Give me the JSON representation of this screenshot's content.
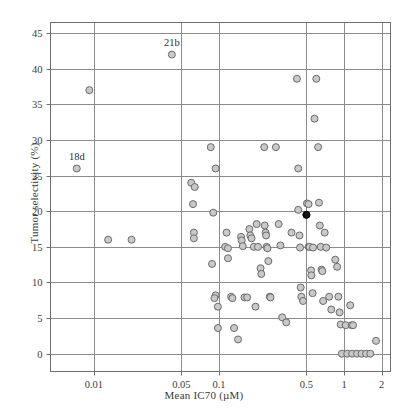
{
  "chart_data": {
    "type": "scatter",
    "title": "",
    "xlabel": "Mean IC70 (µM)",
    "ylabel": "Tumor selectivity (%)",
    "xscale": "log",
    "yscale": "linear",
    "xlim": [
      0.0045,
      2.35
    ],
    "ylim": [
      -2.5,
      46.5
    ],
    "xticks": [
      0.01,
      0.05,
      0.1,
      0.5,
      1,
      2
    ],
    "xtick_labels": [
      "0.01",
      "0.05",
      "0.1",
      "0.5",
      "1",
      "2"
    ],
    "yticks": [
      0,
      5,
      10,
      15,
      20,
      25,
      30,
      35,
      40,
      45
    ],
    "ytick_labels": [
      "0",
      "5",
      "10",
      "15",
      "20",
      "25",
      "30",
      "35",
      "40",
      "45"
    ],
    "grid": true,
    "grid_color": "#8c8c8c",
    "frame_color": "#6f6f6f",
    "legend": "none",
    "marker_fill": "#c9c9c9",
    "marker_edge": "#6a6a6a",
    "highlight_fill": "#151515",
    "highlight_edge": "#000000",
    "marker_size": 7,
    "annotations": [
      {
        "label": "21b",
        "x": 0.042,
        "y": 42
      },
      {
        "label": "18d",
        "x": 0.0073,
        "y": 26
      }
    ],
    "highlight_points": [
      {
        "x": 0.5,
        "y": 19.5
      }
    ],
    "points": [
      {
        "x": 0.0073,
        "y": 26
      },
      {
        "x": 0.0092,
        "y": 37
      },
      {
        "x": 0.013,
        "y": 16
      },
      {
        "x": 0.02,
        "y": 16
      },
      {
        "x": 0.042,
        "y": 42
      },
      {
        "x": 0.06,
        "y": 24
      },
      {
        "x": 0.064,
        "y": 23.4
      },
      {
        "x": 0.062,
        "y": 21
      },
      {
        "x": 0.063,
        "y": 17
      },
      {
        "x": 0.063,
        "y": 16.2
      },
      {
        "x": 0.086,
        "y": 29
      },
      {
        "x": 0.094,
        "y": 26
      },
      {
        "x": 0.09,
        "y": 19.8
      },
      {
        "x": 0.088,
        "y": 12.6
      },
      {
        "x": 0.094,
        "y": 8.2
      },
      {
        "x": 0.092,
        "y": 7.8
      },
      {
        "x": 0.098,
        "y": 6.6
      },
      {
        "x": 0.098,
        "y": 3.6
      },
      {
        "x": 0.115,
        "y": 17
      },
      {
        "x": 0.112,
        "y": 15
      },
      {
        "x": 0.118,
        "y": 14.8
      },
      {
        "x": 0.118,
        "y": 13.4
      },
      {
        "x": 0.125,
        "y": 8.0
      },
      {
        "x": 0.128,
        "y": 7.8
      },
      {
        "x": 0.132,
        "y": 3.6
      },
      {
        "x": 0.142,
        "y": 2.0
      },
      {
        "x": 0.15,
        "y": 16.4
      },
      {
        "x": 0.152,
        "y": 15.9
      },
      {
        "x": 0.155,
        "y": 15.1
      },
      {
        "x": 0.16,
        "y": 7.9
      },
      {
        "x": 0.168,
        "y": 7.9
      },
      {
        "x": 0.175,
        "y": 17.5
      },
      {
        "x": 0.178,
        "y": 16.6
      },
      {
        "x": 0.182,
        "y": 16.2
      },
      {
        "x": 0.19,
        "y": 15.0
      },
      {
        "x": 0.196,
        "y": 6.6
      },
      {
        "x": 0.2,
        "y": 18.2
      },
      {
        "x": 0.205,
        "y": 15.0
      },
      {
        "x": 0.215,
        "y": 12.0
      },
      {
        "x": 0.218,
        "y": 11.2
      },
      {
        "x": 0.23,
        "y": 29
      },
      {
        "x": 0.232,
        "y": 18.0
      },
      {
        "x": 0.236,
        "y": 17.0
      },
      {
        "x": 0.238,
        "y": 16.6
      },
      {
        "x": 0.24,
        "y": 15.0
      },
      {
        "x": 0.244,
        "y": 14.8
      },
      {
        "x": 0.248,
        "y": 13.0
      },
      {
        "x": 0.255,
        "y": 8.0
      },
      {
        "x": 0.258,
        "y": 7.9
      },
      {
        "x": 0.285,
        "y": 29
      },
      {
        "x": 0.3,
        "y": 18.2
      },
      {
        "x": 0.31,
        "y": 15.2
      },
      {
        "x": 0.32,
        "y": 5.1
      },
      {
        "x": 0.345,
        "y": 4.4
      },
      {
        "x": 0.38,
        "y": 17.0
      },
      {
        "x": 0.42,
        "y": 38.6
      },
      {
        "x": 0.43,
        "y": 26.0
      },
      {
        "x": 0.43,
        "y": 20.2
      },
      {
        "x": 0.44,
        "y": 16.6
      },
      {
        "x": 0.445,
        "y": 14.9
      },
      {
        "x": 0.45,
        "y": 9.3
      },
      {
        "x": 0.455,
        "y": 8.0
      },
      {
        "x": 0.47,
        "y": 7.4
      },
      {
        "x": 0.5,
        "y": 19.5
      },
      {
        "x": 0.505,
        "y": 21.1
      },
      {
        "x": 0.52,
        "y": 21.0
      },
      {
        "x": 0.52,
        "y": 15.0
      },
      {
        "x": 0.53,
        "y": 15.0
      },
      {
        "x": 0.545,
        "y": 11.7
      },
      {
        "x": 0.548,
        "y": 11.0
      },
      {
        "x": 0.56,
        "y": 8.5
      },
      {
        "x": 0.565,
        "y": 14.9
      },
      {
        "x": 0.58,
        "y": 33
      },
      {
        "x": 0.6,
        "y": 38.6
      },
      {
        "x": 0.62,
        "y": 29
      },
      {
        "x": 0.63,
        "y": 21.2
      },
      {
        "x": 0.64,
        "y": 18.0
      },
      {
        "x": 0.65,
        "y": 15.0
      },
      {
        "x": 0.66,
        "y": 11.8
      },
      {
        "x": 0.67,
        "y": 11.6
      },
      {
        "x": 0.68,
        "y": 7.4
      },
      {
        "x": 0.7,
        "y": 17.0
      },
      {
        "x": 0.72,
        "y": 14.9
      },
      {
        "x": 0.76,
        "y": 8.0
      },
      {
        "x": 0.79,
        "y": 6.2
      },
      {
        "x": 0.85,
        "y": 13.2
      },
      {
        "x": 0.88,
        "y": 12.2
      },
      {
        "x": 0.9,
        "y": 8.0
      },
      {
        "x": 0.92,
        "y": 5.8
      },
      {
        "x": 0.94,
        "y": 4.1
      },
      {
        "x": 0.96,
        "y": 0.0
      },
      {
        "x": 1.03,
        "y": 4.0
      },
      {
        "x": 1.06,
        "y": 0.0
      },
      {
        "x": 1.12,
        "y": 6.8
      },
      {
        "x": 1.15,
        "y": 4.0
      },
      {
        "x": 1.18,
        "y": 4.0
      },
      {
        "x": 1.16,
        "y": 0.0
      },
      {
        "x": 1.27,
        "y": 0.0
      },
      {
        "x": 1.38,
        "y": 0.0
      },
      {
        "x": 1.5,
        "y": 0.0
      },
      {
        "x": 1.8,
        "y": 1.8
      },
      {
        "x": 1.62,
        "y": 0.0
      }
    ]
  }
}
